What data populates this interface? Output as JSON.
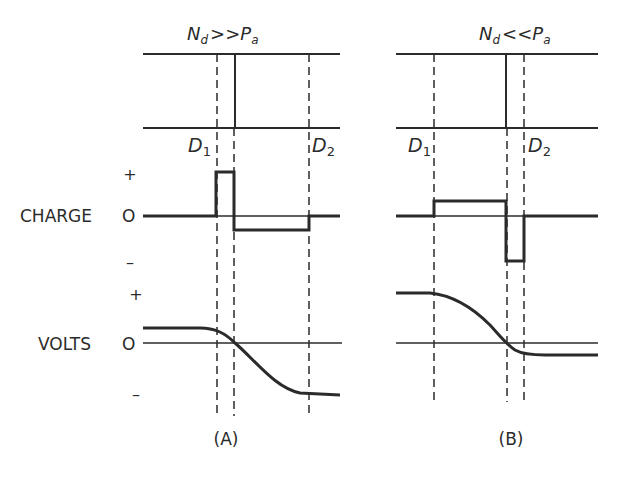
{
  "figure": {
    "panels": [
      {
        "id": "A",
        "caption": "(A)",
        "condition": {
          "n": "N",
          "n_sub": "d",
          "relation": ">>",
          "p": "P",
          "p_sub": "a"
        },
        "d1": {
          "letter": "D",
          "sub": "1"
        },
        "d2": {
          "letter": "D",
          "sub": "2"
        }
      },
      {
        "id": "B",
        "caption": "(B)",
        "condition": {
          "n": "N",
          "n_sub": "d",
          "relation": "<<",
          "p": "P",
          "p_sub": "a"
        },
        "d1": {
          "letter": "D",
          "sub": "1"
        },
        "d2": {
          "letter": "D",
          "sub": "2"
        }
      }
    ],
    "rows": {
      "charge": {
        "label": "CHARGE",
        "zero": "O",
        "plus": "+",
        "minus": "–"
      },
      "volts": {
        "label": "VOLTS",
        "zero": "O",
        "plus": "+",
        "minus": "–"
      }
    },
    "colors": {
      "ink": "#2b2b2b",
      "background": "#ffffff"
    }
  }
}
